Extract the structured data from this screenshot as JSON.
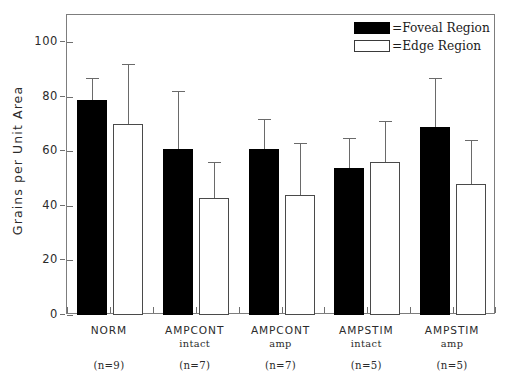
{
  "chart_data": {
    "type": "bar",
    "title": "",
    "xlabel": "",
    "ylabel": "Grains per Unit Area",
    "ylim": [
      0,
      110
    ],
    "yticks": [
      0,
      20,
      40,
      60,
      80,
      100
    ],
    "ytick_labels": [
      "0",
      "20",
      "40",
      "60",
      "80",
      "100"
    ],
    "grid": false,
    "legend_position": "top-right",
    "categories": [
      "NORM",
      "AMPCONT intact",
      "AMPCONT amp",
      "AMPSTIM intact",
      "AMPSTIM amp"
    ],
    "category_lines": [
      {
        "line1": "NORM",
        "line2": "",
        "n": "(n=9)"
      },
      {
        "line1": "AMPCONT",
        "line2": "intact",
        "n": "(n=7)"
      },
      {
        "line1": "AMPCONT",
        "line2": "amp",
        "n": "(n=7)"
      },
      {
        "line1": "AMPSTIM",
        "line2": "intact",
        "n": "(n=5)"
      },
      {
        "line1": "AMPSTIM",
        "line2": "amp",
        "n": "(n=5)"
      }
    ],
    "series": [
      {
        "name": "=Foveal Region",
        "style": "filled",
        "color": "#000000",
        "values": [
          79,
          61,
          61,
          54,
          69
        ],
        "errors_upper": [
          87,
          82,
          72,
          65,
          87
        ]
      },
      {
        "name": "=Edge Region",
        "style": "open",
        "color": "#ffffff",
        "values": [
          70,
          43,
          44,
          56,
          48
        ],
        "errors_upper": [
          92,
          56,
          63,
          71,
          64
        ]
      }
    ]
  },
  "legend": {
    "items": [
      {
        "label": "=Foveal Region",
        "swatch": "filled-square-icon"
      },
      {
        "label": "=Edge Region",
        "swatch": "open-square-icon"
      }
    ]
  },
  "axis": {
    "y_title": "Grains per Unit Area"
  }
}
